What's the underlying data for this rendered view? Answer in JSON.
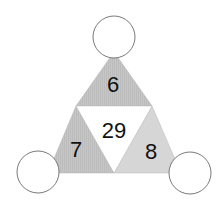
{
  "puzzle": {
    "top_value": "6",
    "left_value": "7",
    "right_value": "8",
    "center_value": "29",
    "circles": {
      "top": "",
      "left": "",
      "right": ""
    }
  },
  "colors": {
    "shaded_top": "#c4c4c4",
    "shaded_left": "#c2c2c2",
    "shaded_right": "#d4d4d4",
    "center": "#ffffff",
    "stroke": "#8a8a8a",
    "circle_fill": "#ffffff",
    "circle_stroke": "#7a7a7a"
  }
}
